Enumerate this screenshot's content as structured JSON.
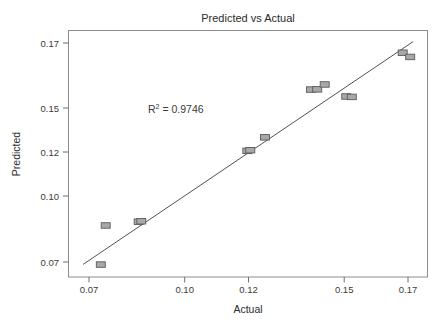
{
  "chart_data": {
    "type": "scatter",
    "title": "Predicted vs Actual",
    "xlabel": "Actual",
    "ylabel": "Predicted",
    "xlim": [
      0.0655,
      0.1755
    ],
    "ylim": [
      0.0645,
      0.1755
    ],
    "xticks": [
      "0.07",
      "0.10",
      "0.12",
      "0.15",
      "0.17"
    ],
    "xtick_values": [
      0.07,
      0.1,
      0.12,
      0.15,
      0.17
    ],
    "yticks": [
      "0.07",
      "0.10",
      "0.12",
      "0.15",
      "0.17"
    ],
    "ytick_values": [
      0.07,
      0.1,
      0.12,
      0.15,
      0.17
    ],
    "grid": false,
    "legend": "none",
    "annotations": [
      {
        "name": "r-squared",
        "base": "R",
        "superscript": "2",
        "rest": " = 0.9746",
        "text": "R2 = 0.9746",
        "value": 0.9746,
        "x": 0.0995,
        "y": 0.1395
      }
    ],
    "series": [
      {
        "name": "Predicted vs Actual points",
        "marker": "square",
        "marker_fill": "#a8a8a8",
        "marker_edge": "#5a5a5a",
        "points": [
          {
            "x": 0.0754,
            "y": 0.0701
          },
          {
            "x": 0.0769,
            "y": 0.0877
          },
          {
            "x": 0.087,
            "y": 0.0894
          },
          {
            "x": 0.0878,
            "y": 0.0896
          },
          {
            "x": 0.1203,
            "y": 0.1213
          },
          {
            "x": 0.1212,
            "y": 0.1216
          },
          {
            "x": 0.1257,
            "y": 0.1274
          },
          {
            "x": 0.1398,
            "y": 0.1489
          },
          {
            "x": 0.1417,
            "y": 0.149
          },
          {
            "x": 0.144,
            "y": 0.1512
          },
          {
            "x": 0.1506,
            "y": 0.1458
          },
          {
            "x": 0.1523,
            "y": 0.1456
          },
          {
            "x": 0.1679,
            "y": 0.1655
          },
          {
            "x": 0.1702,
            "y": 0.1636
          }
        ]
      }
    ],
    "fit_line": {
      "name": "regression-line",
      "x_start": 0.07,
      "y_start": 0.0702,
      "x_end": 0.1711,
      "y_end": 0.1705,
      "color": "#3d3d3d"
    }
  }
}
